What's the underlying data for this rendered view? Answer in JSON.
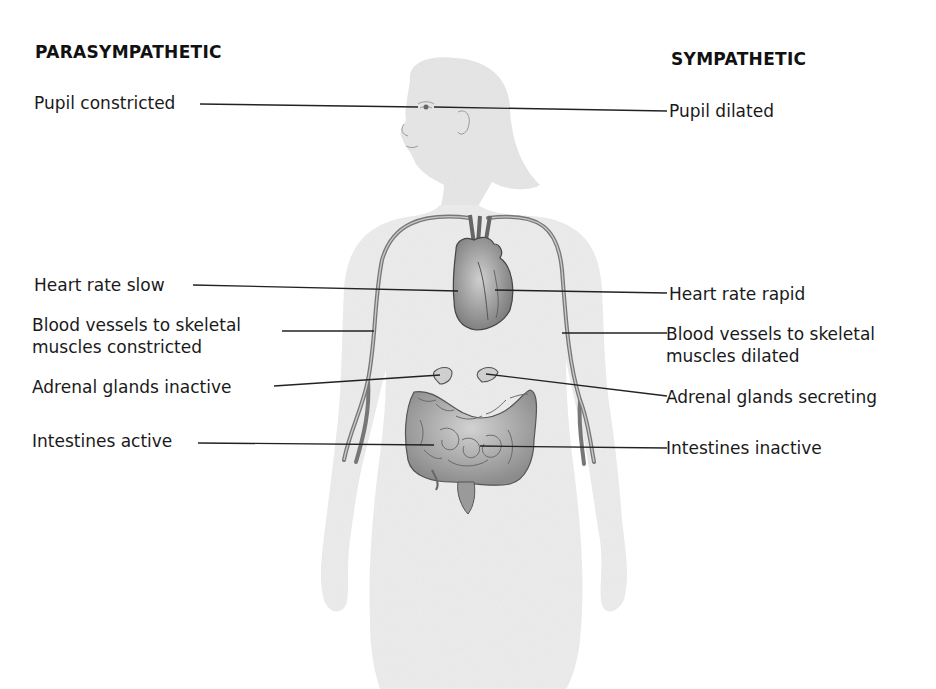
{
  "headings": {
    "left": "PARASYMPATHETIC",
    "right": "SYMPATHETIC"
  },
  "parasympathetic_labels": [
    {
      "text": "Pupil constricted",
      "target": "eye"
    },
    {
      "text": "Heart rate slow",
      "target": "heart"
    },
    {
      "text": "Blood vessels to skeletal muscles constricted",
      "line1": "Blood vessels to skeletal",
      "line2": "muscles constricted",
      "target": "right-arm-vessel"
    },
    {
      "text": "Adrenal glands inactive",
      "target": "right-adrenal-gland"
    },
    {
      "text": "Intestines active",
      "target": "intestines"
    }
  ],
  "sympathetic_labels": [
    {
      "text": "Pupil dilated",
      "target": "eye"
    },
    {
      "text": "Heart rate rapid",
      "target": "heart"
    },
    {
      "text": "Blood vessels to skeletal muscles dilated",
      "line1": "Blood vessels to skeletal",
      "line2": "muscles dilated",
      "target": "left-arm-vessel"
    },
    {
      "text": "Adrenal glands secreting",
      "target": "left-adrenal-gland"
    },
    {
      "text": "Intestines inactive",
      "target": "intestines"
    }
  ],
  "colors": {
    "body_fill": "#ececec",
    "organ_fill": "#b9b9b9",
    "organ_stroke": "#555555",
    "leader_line": "#222222",
    "text": "#1a1a1a"
  }
}
